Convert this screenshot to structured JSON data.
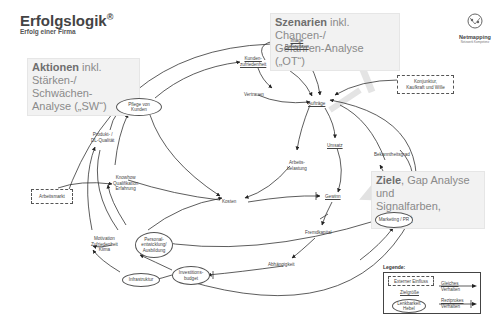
{
  "header": {
    "title": "Erfolgslogik",
    "title_mark": "®",
    "subtitle": "Erfolg einer Firma"
  },
  "callouts": {
    "actions": {
      "bold": "Aktionen",
      "rest": " inkl.",
      "line2": "Stärken-/ Schwächen-",
      "line3": "Analyse („SW“)"
    },
    "scenarios": {
      "bold": "Szenarien",
      "rest": " inkl. Chancen-/",
      "line2": "Gefahren-Analyse („OT“)"
    },
    "goals": {
      "bold": "Ziele",
      "rest": ", Gap Analyse und",
      "line2": "Signalfarben, Cockpit"
    }
  },
  "logo": {
    "name": "Netmapping",
    "tagline": "Netzwerk Kompetenz"
  },
  "nodes": {
    "kundenzufriedenheit": [
      "Kunden-",
      "zufriedenheit"
    ],
    "image_referenzen": [
      "Image",
      "Referenzen"
    ],
    "vertrauen": "Vertrauen",
    "auftraege": "Aufträge",
    "pflege_kunden": [
      "Pflege von",
      "Kunden"
    ],
    "konjunktur": [
      "Konjunktur,",
      "Kaufkraft und Wille"
    ],
    "produkt_qualitaet": [
      "Produkt- /",
      "DL-Qualität"
    ],
    "arbeitsbelastung": [
      "Arbeits-",
      "belastung"
    ],
    "umsatz": "Umsatz",
    "knowhow": [
      "Knowhow",
      "Qualifikation",
      "Erfahrung"
    ],
    "bekanntheitsgrad": "Bekanntheitsgrad",
    "arbeitsmarkt": "Arbeitsmarkt",
    "kosten": "Kosten",
    "gewinn": "Gewinn",
    "marketing": "Marketing / PR",
    "motivation": [
      "Motivation",
      "Zufriedenheit",
      "Klima"
    ],
    "personalentwicklung": [
      "Personal-",
      "entwicklung/",
      "Ausbildung"
    ],
    "fremdkapital": "Fremdkapital",
    "abhaengigkeit": "Abhängigkeit",
    "infrastruktur": "Infrastruktur",
    "investitionsbudget": [
      "Investitions-",
      "budget"
    ]
  },
  "legend": {
    "title": "Legende:",
    "external": "Externer Einfluss",
    "goal": "Zielgröße",
    "lever": [
      "Lenkbarkeit",
      "Hebel"
    ],
    "same": [
      "Gleiches",
      "Verhalten"
    ],
    "reciprocal": [
      "Reziprokes",
      "Verhalten"
    ]
  },
  "colors": {
    "line": "#333333",
    "callout_bg": "#f2f2f2",
    "callout_text": "#8a8a8a"
  }
}
